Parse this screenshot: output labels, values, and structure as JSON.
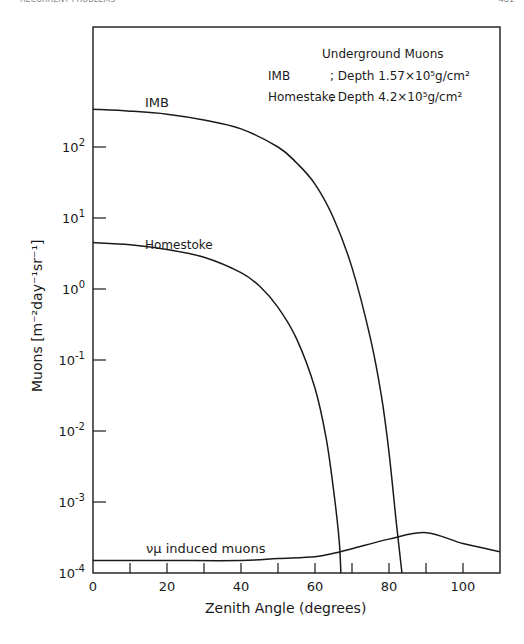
{
  "page": {
    "running_head": "RECURRENT PROBLEMS",
    "page_number": "481"
  },
  "chart_data": {
    "type": "line",
    "title": "Underground Muons",
    "legend": [
      {
        "label": "IMB",
        "desc": "; Depth 1.57×10⁵g/cm²"
      },
      {
        "label": "Homestake",
        "desc": "; Depth 4.2×10⁵g/cm²"
      }
    ],
    "xlabel": "Zenith Angle (degrees)",
    "ylabel": "Muons [m⁻²day⁻¹sr⁻¹]",
    "xlim": [
      0,
      110
    ],
    "ylim": [
      0.0001,
      1000
    ],
    "yscale": "log",
    "x_ticks": [
      0,
      20,
      40,
      60,
      80,
      100
    ],
    "x_minor_ticks": [
      10,
      30,
      50,
      70,
      90
    ],
    "y_ticks": [
      "10^2",
      "10^1",
      "10^0",
      "10^-1",
      "10^-2",
      "10^-3",
      "10^-4"
    ],
    "grid": false,
    "series": [
      {
        "name": "IMB",
        "label": "IMB",
        "x": [
          0,
          10,
          20,
          30,
          40,
          50,
          55,
          60,
          65,
          70,
          75,
          78,
          80,
          82,
          83.5
        ],
        "y": [
          340,
          320,
          290,
          240,
          180,
          100,
          60,
          30,
          10,
          2,
          0.2,
          0.03,
          0.005,
          0.0005,
          0.0001
        ]
      },
      {
        "name": "Homestake",
        "label": "Homestoke",
        "x": [
          0,
          10,
          20,
          30,
          40,
          45,
          50,
          55,
          60,
          63,
          65,
          66.5,
          67
        ],
        "y": [
          4.5,
          4.2,
          3.6,
          2.8,
          1.7,
          1.1,
          0.55,
          0.2,
          0.04,
          0.008,
          0.0015,
          0.0003,
          0.0001
        ]
      },
      {
        "name": "νμ induced muons",
        "label": "νμ induced muons",
        "x": [
          0,
          20,
          40,
          50,
          60,
          65,
          70,
          80,
          90,
          100,
          110
        ],
        "y": [
          0.00015,
          0.00015,
          0.00015,
          0.00016,
          0.00017,
          0.00019,
          0.00022,
          0.0003,
          0.00037,
          0.00026,
          0.0002
        ]
      }
    ],
    "annotations": [
      {
        "text": "IMB",
        "near_x": 30,
        "near_y": 400
      },
      {
        "text": "Homestoke",
        "near_x": 30,
        "near_y": 8
      },
      {
        "text": "νμ induced muons",
        "near_x": 40,
        "near_y": 0.00022
      }
    ]
  }
}
